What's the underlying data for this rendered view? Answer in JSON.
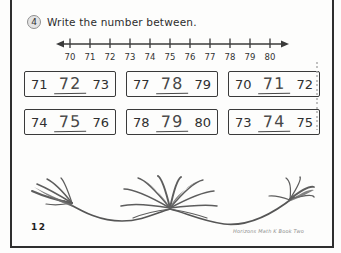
{
  "colors": {
    "ink": "#3a3a3a"
  },
  "exercise": {
    "number": "4",
    "instruction": "Write the number between."
  },
  "number_line": {
    "labels": [
      "70",
      "71",
      "72",
      "73",
      "74",
      "75",
      "76",
      "77",
      "78",
      "79",
      "80"
    ]
  },
  "problems": [
    {
      "left": "71",
      "answer": "72",
      "right": "73"
    },
    {
      "left": "77",
      "answer": "78",
      "right": "79"
    },
    {
      "left": "70",
      "answer": "71",
      "right": "72"
    },
    {
      "left": "74",
      "answer": "75",
      "right": "76"
    },
    {
      "left": "78",
      "answer": "79",
      "right": "80"
    },
    {
      "left": "73",
      "answer": "74",
      "right": "75"
    }
  ],
  "page": {
    "number": "12",
    "footer_right": "Horizons Math K Book Two"
  }
}
